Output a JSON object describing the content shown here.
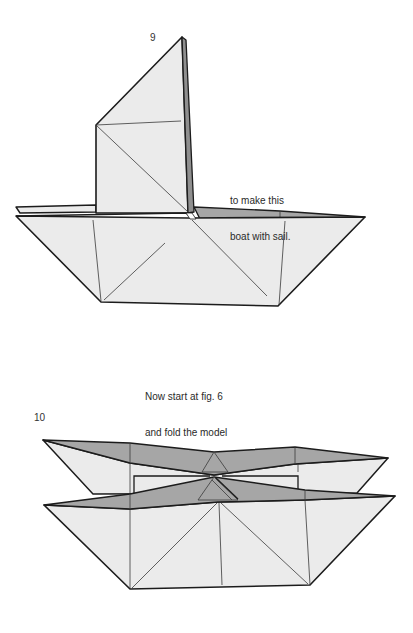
{
  "colors": {
    "paper_light": "#ebebeb",
    "paper_shade": "#a6a6a6",
    "outline": "#1c1c1c",
    "crease": "#3a3a3a",
    "background": "#ffffff"
  },
  "figures": [
    {
      "number": "9",
      "subject": "boat with sail",
      "caption_lines": [
        "to make this",
        "boat with sail."
      ]
    },
    {
      "number": "10",
      "subject": "catamaran",
      "caption_lines": [
        "Now start at fig. 6",
        "and fold the model",
        "in half to",
        "make this",
        "catamaran."
      ]
    }
  ]
}
